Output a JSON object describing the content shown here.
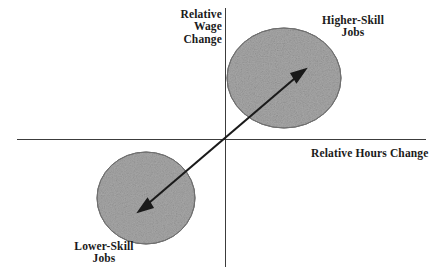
{
  "diagram": {
    "axes": {
      "y_label": "Relative Wage Change",
      "x_label": "Relative Hours Change",
      "y_label_lines": [
        "Relative",
        "Wage",
        "Change"
      ],
      "x_label_lines": [
        "Relative Hours Change"
      ],
      "origin": {
        "x": 225,
        "y": 139
      },
      "x_axis_start": {
        "x": 17,
        "y": 139
      },
      "x_axis_end": {
        "x": 426,
        "y": 139
      },
      "y_axis_start": {
        "x": 225,
        "y": 8
      },
      "y_axis_end": {
        "x": 225,
        "y": 267
      },
      "axis_color": "#3c3c3c"
    },
    "ellipses": [
      {
        "name": "higher-skill-cluster",
        "label": "Higher-Skill Jobs",
        "label_lines": [
          "Higher-Skill",
          "Jobs"
        ],
        "quadrant": "upper-right",
        "cx": 284,
        "cy": 78,
        "rx": 57,
        "ry": 50,
        "fill": "#a8a8a8",
        "stroke": "#6f6f6f"
      },
      {
        "name": "lower-skill-cluster",
        "label": "Lower-Skill Jobs",
        "label_lines": [
          "Lower-Skill",
          "Jobs"
        ],
        "quadrant": "lower-left",
        "cx": 146,
        "cy": 198,
        "rx": 49,
        "ry": 46,
        "fill": "#a8a8a8",
        "stroke": "#6f6f6f"
      }
    ],
    "arrow": {
      "name": "trend-arrow",
      "description": "double-headed arrow through origin from lower-skill cluster to higher-skill cluster",
      "from": {
        "x": 139,
        "y": 211
      },
      "to": {
        "x": 305,
        "y": 70
      },
      "color": "#1a1a1a",
      "double_headed": true
    },
    "background": "#ffffff"
  }
}
